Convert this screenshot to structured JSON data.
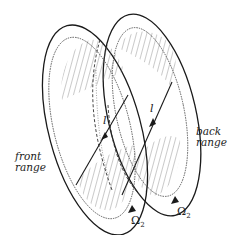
{
  "diagram": {
    "labels": {
      "front_range": [
        "front",
        "range"
      ],
      "back_range": [
        "back",
        "range"
      ],
      "line_front": "l",
      "line_back": "l",
      "omega_front": "Ω",
      "omega_front_sub": "2",
      "omega_back": "Ω",
      "omega_back_sub": "2"
    },
    "colors": {
      "stroke": "#1a1a1a",
      "hatch": "#555555",
      "background": "#ffffff"
    }
  }
}
